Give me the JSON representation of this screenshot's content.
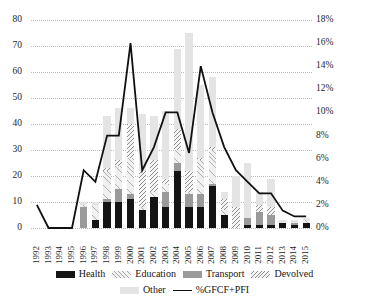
{
  "chart_data": {
    "type": "bar",
    "title": "",
    "xlabel": "",
    "ylabel": "",
    "y2label": "",
    "grid": true,
    "legend_position": "bottom",
    "stacked": true,
    "ylim": [
      0,
      80
    ],
    "yticks": [
      0,
      10,
      20,
      30,
      40,
      50,
      60,
      70,
      80
    ],
    "ytick_labels": [
      "0",
      "10",
      "20",
      "30",
      "40",
      "50",
      "60",
      "70",
      "80"
    ],
    "y2lim": [
      0,
      18
    ],
    "y2ticks": [
      0,
      2,
      4,
      6,
      8,
      10,
      12,
      14,
      16,
      18
    ],
    "y2tick_labels": [
      "0%",
      "2%",
      "4%",
      "6%",
      "8%",
      "10%",
      "12%",
      "14%",
      "16%",
      "18%"
    ],
    "categories": [
      "1992",
      "1993",
      "1994",
      "1995",
      "1996",
      "1997",
      "1998",
      "1999",
      "2000",
      "2001",
      "2002",
      "2003",
      "2004",
      "2005",
      "2006",
      "2007",
      "2008",
      "2009",
      "2010",
      "2011",
      "2012",
      "2013",
      "2014",
      "2015"
    ],
    "series": [
      {
        "name": "Health",
        "color": "#141414",
        "values": [
          0,
          0,
          0,
          0,
          0,
          3,
          10,
          10,
          11,
          7,
          12,
          8,
          22,
          8,
          8,
          16,
          5,
          0,
          1,
          1,
          1,
          2,
          1,
          2
        ]
      },
      {
        "name": "Education",
        "color": "#f0f0f0",
        "pattern": "hatch-45",
        "values": [
          0,
          0,
          0,
          0,
          1,
          6,
          11,
          9,
          14,
          1,
          2,
          3,
          5,
          1,
          13,
          13,
          2,
          0,
          0,
          0,
          0,
          0,
          0,
          1
        ]
      },
      {
        "name": "Transport",
        "color": "#9a9a9a",
        "values": [
          0,
          0,
          0,
          0,
          8,
          0,
          1,
          5,
          2,
          0,
          0,
          6,
          3,
          5,
          5,
          1,
          0,
          0,
          3,
          5,
          4,
          0,
          1,
          0
        ]
      },
      {
        "name": "Devolved",
        "color": "#f4f4f4",
        "pattern": "hatch-135",
        "values": [
          0,
          0,
          0,
          0,
          0,
          0,
          1,
          2,
          13,
          14,
          12,
          2,
          8,
          8,
          1,
          1,
          4,
          8,
          0,
          3,
          3,
          0,
          0,
          0
        ]
      },
      {
        "name": "Other",
        "color": "#e4e4e4",
        "values": [
          0,
          0,
          0,
          0,
          1,
          1,
          20,
          20,
          6,
          22,
          17,
          26,
          31,
          53,
          28,
          27,
          3,
          12,
          21,
          5,
          11,
          1,
          1,
          1
        ]
      }
    ],
    "line_series": {
      "name": "%GFCF+PFI",
      "color": "#111111",
      "axis": "right",
      "unit": "%",
      "values": [
        2.0,
        0.0,
        0.0,
        0.0,
        5.0,
        4.0,
        8.0,
        8.0,
        16.0,
        5.0,
        7.0,
        10.0,
        10.0,
        6.5,
        14.0,
        10.0,
        7.0,
        5.0,
        4.0,
        3.0,
        3.0,
        1.5,
        1.0,
        1.0
      ]
    }
  },
  "legend": {
    "items": [
      {
        "label": "Health",
        "key": "health"
      },
      {
        "label": "Education",
        "key": "education"
      },
      {
        "label": "Transport",
        "key": "transport"
      },
      {
        "label": "Devolved",
        "key": "devolved"
      },
      {
        "label": "Other",
        "key": "other"
      },
      {
        "label": "%GFCF+PFI",
        "key": "line"
      }
    ]
  }
}
